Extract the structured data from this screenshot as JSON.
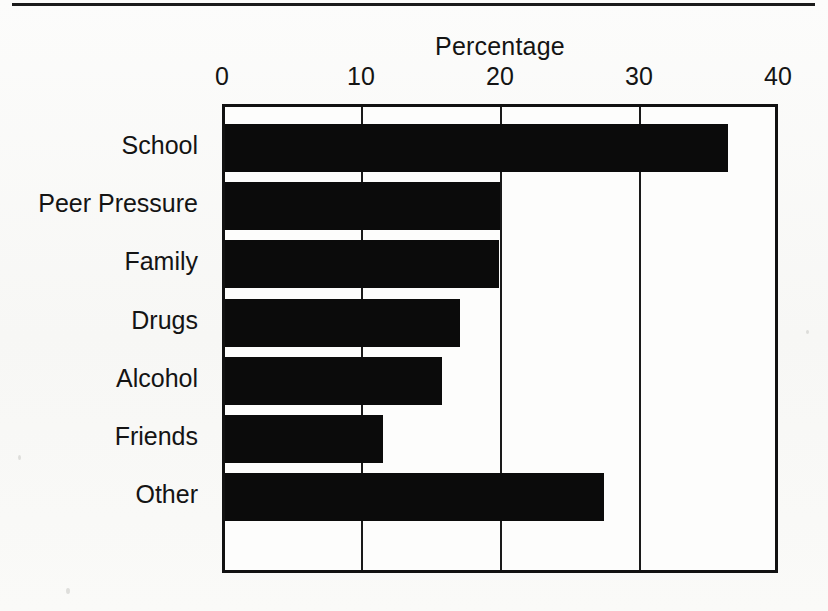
{
  "figure": {
    "top_rule": "horizontal-rule",
    "background_color": "#fbfbfa",
    "ink_color": "#0b0b0b"
  },
  "chart_data": {
    "type": "bar",
    "orientation": "horizontal",
    "title": "Percentage",
    "xlabel": "",
    "ylabel": "",
    "categories": [
      "School",
      "Peer Pressure",
      "Family",
      "Drugs",
      "Alcohol",
      "Friends",
      "Other"
    ],
    "values": [
      36.4,
      20.0,
      19.9,
      17.1,
      15.8,
      11.6,
      27.5
    ],
    "xlim": [
      0,
      40
    ],
    "xticks": [
      0,
      10,
      20,
      30,
      40
    ],
    "xtick_labels": [
      "0",
      "10",
      "20",
      "30",
      "40"
    ],
    "grid": "vertical-only",
    "legend": "none",
    "bar_color": "#0b0b0b"
  }
}
